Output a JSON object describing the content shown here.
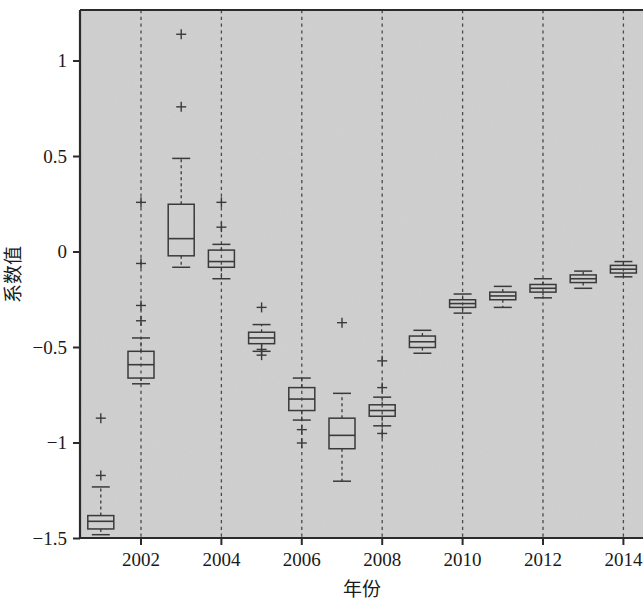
{
  "chart_data": {
    "type": "box",
    "title": "",
    "xlabel": "年份",
    "ylabel": "系数值",
    "xlim": [
      2000.4,
      2014.6
    ],
    "ylim": [
      -1.58,
      1.25
    ],
    "grid": true,
    "grid_axis": "x",
    "legend": "none",
    "x_tick_labels": [
      "2002",
      "2004",
      "2006",
      "2008",
      "2010",
      "2012",
      "2014"
    ],
    "x_tick_values": [
      2002,
      2004,
      2006,
      2008,
      2010,
      2012,
      2014
    ],
    "y_tick_labels": [
      "1",
      "0.5",
      "0",
      "-0.5",
      "-1",
      "-1.5"
    ],
    "y_tick_values": [
      1,
      0.5,
      0,
      -0.5,
      -1,
      -1.5
    ],
    "boxes": [
      {
        "x": 2001,
        "whisker_low": -1.48,
        "q1": -1.45,
        "median": -1.41,
        "q3": -1.38,
        "whisker_high": -1.23,
        "outliers": [
          -1.17,
          -0.87
        ]
      },
      {
        "x": 2002,
        "whisker_low": -0.69,
        "q1": -0.66,
        "median": -0.59,
        "q3": -0.52,
        "whisker_high": -0.45,
        "outliers": [
          -0.36,
          -0.28,
          -0.06,
          0.26
        ]
      },
      {
        "x": 2003,
        "whisker_low": -0.08,
        "q1": -0.02,
        "median": 0.07,
        "q3": 0.25,
        "whisker_high": 0.49,
        "outliers": [
          0.76,
          1.14
        ]
      },
      {
        "x": 2004,
        "whisker_low": -0.14,
        "q1": -0.08,
        "median": -0.05,
        "q3": 0.01,
        "whisker_high": 0.04,
        "outliers": [
          0.13,
          0.26
        ]
      },
      {
        "x": 2005,
        "whisker_low": -0.52,
        "q1": -0.48,
        "median": -0.45,
        "q3": -0.42,
        "whisker_high": -0.38,
        "outliers": [
          -0.54,
          -0.51,
          -0.29
        ]
      },
      {
        "x": 2006,
        "whisker_low": -0.88,
        "q1": -0.83,
        "median": -0.77,
        "q3": -0.71,
        "whisker_high": -0.66,
        "outliers": [
          -0.93,
          -1.0
        ]
      },
      {
        "x": 2007,
        "whisker_low": -1.2,
        "q1": -1.03,
        "median": -0.96,
        "q3": -0.87,
        "whisker_high": -0.74,
        "outliers": [
          -0.37
        ]
      },
      {
        "x": 2008,
        "whisker_low": -0.91,
        "q1": -0.86,
        "median": -0.83,
        "q3": -0.8,
        "whisker_high": -0.76,
        "outliers": [
          -0.95,
          -0.71,
          -0.57
        ]
      },
      {
        "x": 2009,
        "whisker_low": -0.53,
        "q1": -0.5,
        "median": -0.47,
        "q3": -0.44,
        "whisker_high": -0.41,
        "outliers": []
      },
      {
        "x": 2010,
        "whisker_low": -0.32,
        "q1": -0.29,
        "median": -0.27,
        "q3": -0.25,
        "whisker_high": -0.22,
        "outliers": []
      },
      {
        "x": 2011,
        "whisker_low": -0.29,
        "q1": -0.25,
        "median": -0.23,
        "q3": -0.21,
        "whisker_high": -0.18,
        "outliers": []
      },
      {
        "x": 2012,
        "whisker_low": -0.24,
        "q1": -0.21,
        "median": -0.19,
        "q3": -0.17,
        "whisker_high": -0.14,
        "outliers": []
      },
      {
        "x": 2013,
        "whisker_low": -0.19,
        "q1": -0.16,
        "median": -0.14,
        "q3": -0.12,
        "whisker_high": -0.1,
        "outliers": []
      },
      {
        "x": 2014,
        "whisker_low": -0.13,
        "q1": -0.11,
        "median": -0.09,
        "q3": -0.07,
        "whisker_high": -0.05,
        "outliers": []
      }
    ]
  },
  "style": {
    "panel_background": "#cfcfcf",
    "page_background": "#ffffff",
    "line_color": "#3a3a3a",
    "axis_color": "#2b2b2b",
    "grid_color": "#4a4a4a"
  },
  "geometry": {
    "plot_left": 80,
    "plot_right": 643,
    "plot_top": 10,
    "plot_bottom": 538,
    "y_zero_px": 252,
    "y_units_per_px": 191,
    "x_2002_px": 141,
    "x_px_per_year": 40.2
  }
}
